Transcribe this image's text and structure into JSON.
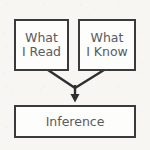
{
  "diagram": {
    "type": "flowchart",
    "colors": {
      "background": "#f7f6f3",
      "box_fill": "#fdfdfb",
      "box_border": "#3a3a3c",
      "text": "#5a5a5e",
      "connector": "#2f2f31"
    },
    "nodes": [
      {
        "id": "what-i-read",
        "line1": "What",
        "line2": "I Read"
      },
      {
        "id": "what-i-know",
        "line1": "What",
        "line2": "I Know"
      },
      {
        "id": "inference",
        "line1": "Inference",
        "line2": ""
      }
    ],
    "connectors": [
      {
        "id": "read-to-inference",
        "from": "what-i-read",
        "to": "inference",
        "style": "diagonal-merge"
      },
      {
        "id": "know-to-inference",
        "from": "what-i-know",
        "to": "inference",
        "style": "diagonal-merge"
      },
      {
        "id": "merge-to-inference",
        "from": "merge-point",
        "to": "inference",
        "style": "vertical-arrow"
      }
    ]
  }
}
